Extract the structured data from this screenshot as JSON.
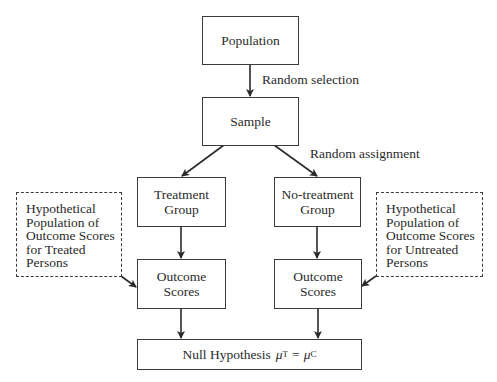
{
  "diagram": {
    "nodes": {
      "population": {
        "label": "Population"
      },
      "sample": {
        "label": "Sample"
      },
      "treatment_group": {
        "line1": "Treatment",
        "line2": "Group"
      },
      "no_treatment_group": {
        "line1": "No-treatment",
        "line2": "Group"
      },
      "outcome_treated": {
        "line1": "Outcome",
        "line2": "Scores"
      },
      "outcome_untreated": {
        "line1": "Outcome",
        "line2": "Scores"
      },
      "null_hypothesis": {
        "text": "Null Hypothesis",
        "mu": "μ",
        "sub_t": "T",
        "equals": "=",
        "sub_c": "C"
      },
      "hypothetical_treated": {
        "lines": [
          "Hypothetical",
          "Population of",
          "Outcome Scores",
          "for Treated",
          "Persons"
        ]
      },
      "hypothetical_untreated": {
        "lines": [
          "Hypothetical",
          "Population of",
          "Outcome Scores",
          "for Untreated",
          "Persons"
        ]
      }
    },
    "edge_labels": {
      "random_selection": "Random selection",
      "random_assignment": "Random assignment"
    },
    "edges": [
      {
        "from": "population",
        "to": "sample",
        "label": "random_selection"
      },
      {
        "from": "sample",
        "to": "treatment_group",
        "label": "random_assignment"
      },
      {
        "from": "sample",
        "to": "no_treatment_group",
        "label": "random_assignment"
      },
      {
        "from": "treatment_group",
        "to": "outcome_treated"
      },
      {
        "from": "no_treatment_group",
        "to": "outcome_untreated"
      },
      {
        "from": "hypothetical_treated",
        "to": "outcome_treated"
      },
      {
        "from": "hypothetical_untreated",
        "to": "outcome_untreated"
      },
      {
        "from": "outcome_treated",
        "to": "null_hypothesis"
      },
      {
        "from": "outcome_untreated",
        "to": "null_hypothesis"
      }
    ],
    "colors": {
      "stroke": "#3a3a3a",
      "text": "#2a2a2a",
      "background": "#ffffff"
    }
  }
}
